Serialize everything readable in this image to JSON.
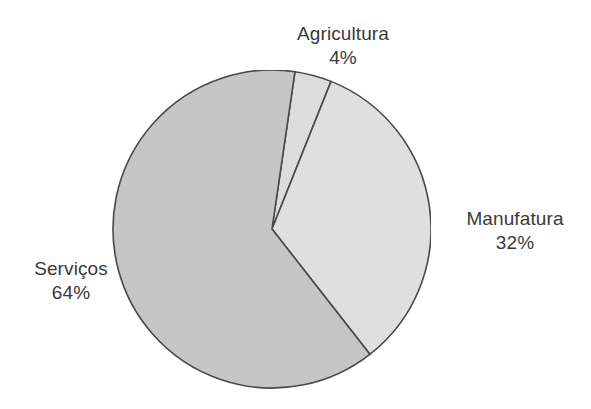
{
  "chart_data": {
    "type": "pie",
    "title": "",
    "subtitle": "",
    "xlabel": "",
    "ylabel": "",
    "legend_position": "none",
    "grid": false,
    "labels_outside": true,
    "start_angle_deg": 8.3,
    "direction": "clockwise",
    "categories": [
      "Agricultura",
      "Manufatura",
      "Serviços"
    ],
    "values": [
      4,
      32,
      64
    ],
    "value_suffix": "%",
    "slices": [
      {
        "name": "Agricultura",
        "value": 4,
        "value_label": "4%",
        "color": "#e0e0e0",
        "start_deg": 8.3,
        "end_deg": 21.8
      },
      {
        "name": "Manufatura",
        "value": 32,
        "value_label": "32%",
        "color": "#e3e3e3",
        "start_deg": 21.8,
        "end_deg": 142.0
      },
      {
        "name": "Serviços",
        "value": 64,
        "value_label": "64%",
        "color": "#c9c9c9",
        "start_deg": 142.0,
        "end_deg": 368.3
      }
    ]
  },
  "geometry": {
    "center_x": 272,
    "center_y": 229,
    "radius": 159,
    "outline_color": "#4a4a4a",
    "background": "#ffffff",
    "text_color": "#3a3a3a"
  },
  "labels": {
    "agricultura": {
      "name": "Agricultura",
      "value": "4%"
    },
    "manufatura": {
      "name": "Manufatura",
      "value": "32%"
    },
    "servicos": {
      "name": "Serviços",
      "value": "64%"
    }
  }
}
